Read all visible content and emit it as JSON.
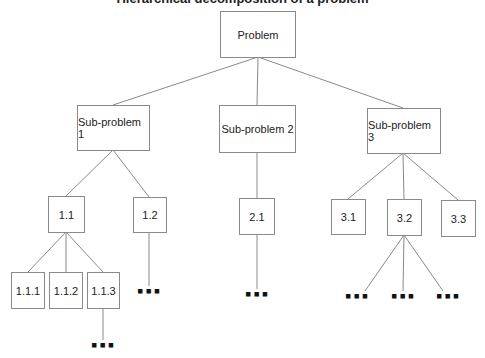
{
  "title": "Hierarchical decomposition of a problem",
  "nodes": {
    "root": "Problem",
    "sp1": "Sub-problem 1",
    "sp2": "Sub-problem 2",
    "sp3": "Sub-problem 3",
    "n1_1": "1.1",
    "n1_2": "1.2",
    "n2_1": "2.1",
    "n3_1": "3.1",
    "n3_2": "3.2",
    "n3_3": "3.3",
    "n1_1_1": "1.1.1",
    "n1_1_2": "1.1.2",
    "n1_1_3": "1.1.3"
  },
  "ellipsis": "▪▪▪"
}
